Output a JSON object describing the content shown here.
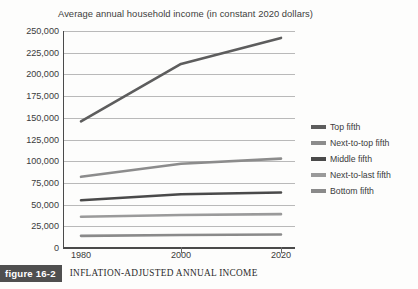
{
  "chart_data": {
    "type": "line",
    "title": "Average annual household income (in constant 2020 dollars)",
    "xlabel": "",
    "ylabel": "",
    "x": [
      1980,
      2000,
      2020
    ],
    "xtick_labels": [
      "1980",
      "2000",
      "2020"
    ],
    "ylim": [
      0,
      250000
    ],
    "ytick_values": [
      0,
      25000,
      50000,
      75000,
      100000,
      125000,
      150000,
      175000,
      200000,
      225000,
      250000
    ],
    "ytick_labels": [
      "0",
      "25,000",
      "50,000",
      "75,000",
      "100,000",
      "125,000",
      "150,000",
      "175,000",
      "200,000",
      "225,000",
      "250,000"
    ],
    "grid": true,
    "legend_position": "right",
    "series": [
      {
        "name": "Top fifth",
        "values": [
          146000,
          212000,
          242000
        ],
        "color": "#5d5d5d"
      },
      {
        "name": "Next-to-top fifth",
        "values": [
          82000,
          97000,
          103000
        ],
        "color": "#8c8c8c"
      },
      {
        "name": "Middle fifth",
        "values": [
          55000,
          62000,
          64000
        ],
        "color": "#4a4a4a"
      },
      {
        "name": "Next-to-last fifth",
        "values": [
          36000,
          38000,
          39000
        ],
        "color": "#9a9a9a"
      },
      {
        "name": "Bottom fifth",
        "values": [
          14000,
          15000,
          15500
        ],
        "color": "#8a8a8a"
      }
    ]
  },
  "caption": {
    "badge": "figure 16-2",
    "text": "INFLATION-ADJUSTED ANNUAL INCOME"
  }
}
